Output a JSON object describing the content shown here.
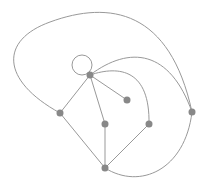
{
  "diagram": {
    "type": "graph",
    "colors": {
      "edge": "#999999",
      "node": "#888888",
      "background": "#ffffff"
    },
    "nodes": [
      {
        "id": "hub",
        "x": 90,
        "y": 75
      },
      {
        "id": "n1",
        "x": 127,
        "y": 100
      },
      {
        "id": "left",
        "x": 60,
        "y": 113
      },
      {
        "id": "mid",
        "x": 105,
        "y": 124
      },
      {
        "id": "rightmid",
        "x": 149,
        "y": 124
      },
      {
        "id": "far",
        "x": 192,
        "y": 112
      },
      {
        "id": "bottom",
        "x": 105,
        "y": 168
      }
    ],
    "edges": [
      {
        "from": "hub",
        "to": "hub",
        "type": "self-loop"
      },
      {
        "from": "hub",
        "to": "n1"
      },
      {
        "from": "hub",
        "to": "left"
      },
      {
        "from": "hub",
        "to": "mid"
      },
      {
        "from": "hub",
        "to": "rightmid",
        "type": "curve"
      },
      {
        "from": "hub",
        "to": "far",
        "type": "curve"
      },
      {
        "from": "left",
        "to": "far",
        "type": "outer-curve"
      },
      {
        "from": "left",
        "to": "bottom"
      },
      {
        "from": "mid",
        "to": "bottom"
      },
      {
        "from": "rightmid",
        "to": "bottom"
      },
      {
        "from": "bottom",
        "to": "far",
        "type": "curve"
      }
    ]
  }
}
